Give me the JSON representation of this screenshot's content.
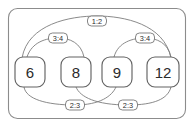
{
  "diagram": {
    "type": "ratio-graph",
    "frame": {
      "border_color": "#8c8c8c",
      "background_color": "#ffffff",
      "corner_radius": 9
    },
    "node_color": "#636363",
    "edge_color": "#7d7d7d",
    "text_color": "#2b2b2b",
    "nodes": [
      {
        "id": "n6",
        "label": "6",
        "cx": 30,
        "cy": 72,
        "w": 30,
        "h": 30,
        "r": 8
      },
      {
        "id": "n8",
        "label": "8",
        "cx": 76,
        "cy": 72,
        "w": 30,
        "h": 30,
        "r": 8
      },
      {
        "id": "n9",
        "label": "9",
        "cx": 117,
        "cy": 72,
        "w": 30,
        "h": 30,
        "r": 8
      },
      {
        "id": "n12",
        "label": "12",
        "cx": 163,
        "cy": 72,
        "w": 32,
        "h": 30,
        "r": 8
      }
    ],
    "edges": [
      {
        "id": "e-6-12",
        "from": "6",
        "to": "12",
        "label": "1:2",
        "label_x": 97,
        "label_y": 21,
        "path": "M 22 58 C 28 24, 70 16, 97 16 C 124 16, 164 24, 171 58"
      },
      {
        "id": "e-6-8",
        "from": "6",
        "to": "8",
        "label": "3:4",
        "label_x": 58,
        "label_y": 46,
        "path": "M 27 57 C 32 42, 46 38, 58 38 C 70 38, 81 43, 84 57"
      },
      {
        "id": "e-9-12",
        "from": "9",
        "to": "12",
        "label": "3:4",
        "label_x": 145,
        "label_y": 46,
        "path": "M 114 57 C 118 42, 133 38, 145 38 C 157 38, 168 43, 171 57"
      },
      {
        "id": "e-6-9",
        "from": "6",
        "to": "9",
        "label": "2:3",
        "label_x": 75,
        "label_y": 105,
        "path": "M 24 87 C 26 99, 46 105, 75 105 C 100 105, 112 96, 116 87"
      },
      {
        "id": "e-8-12",
        "from": "8",
        "to": "12",
        "label": "2:3",
        "label_x": 128,
        "label_y": 105,
        "path": "M 76 87 C 80 97, 96 105, 128 105 C 154 105, 168 99, 171 87"
      }
    ],
    "label_pill": {
      "width": 19,
      "height": 10,
      "radius": 4
    }
  }
}
